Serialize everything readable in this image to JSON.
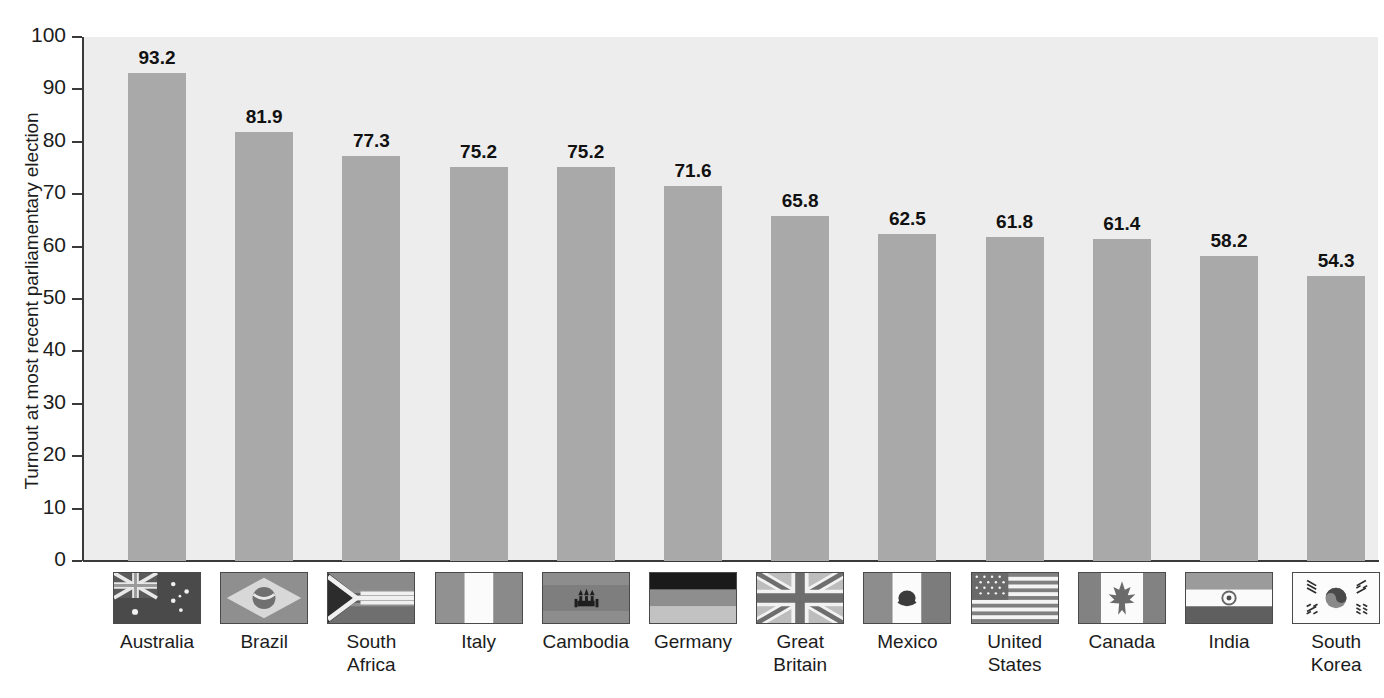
{
  "chart_data": {
    "type": "bar",
    "title": "",
    "xlabel": "",
    "ylabel": "Turnout at most recent parliamentary election",
    "ylim": [
      0,
      100
    ],
    "ytick_labels": [
      "100",
      "90",
      "80",
      "70",
      "60",
      "50",
      "40",
      "30",
      "20",
      "10",
      "0"
    ],
    "yticks": [
      100,
      90,
      80,
      70,
      60,
      50,
      40,
      30,
      20,
      10,
      0
    ],
    "grid": false,
    "legend": "none",
    "categories": [
      "Australia",
      "Brazil",
      "South\nAfrica",
      "Italy",
      "Cambodia",
      "Germany",
      "Great\nBritain",
      "Mexico",
      "United\nStates",
      "Canada",
      "India",
      "South\nKorea"
    ],
    "values": [
      93.2,
      81.9,
      77.3,
      75.2,
      75.2,
      71.6,
      65.8,
      62.5,
      61.8,
      61.4,
      58.2,
      54.3
    ],
    "value_labels": [
      "93.2",
      "81.9",
      "77.3",
      "75.2",
      "75.2",
      "71.6",
      "65.8",
      "62.5",
      "61.8",
      "61.4",
      "58.2",
      "54.3"
    ],
    "flag_icons": [
      "flag-australia-icon",
      "flag-brazil-icon",
      "flag-south-africa-icon",
      "flag-italy-icon",
      "flag-cambodia-icon",
      "flag-germany-icon",
      "flag-great-britain-icon",
      "flag-mexico-icon",
      "flag-united-states-icon",
      "flag-canada-icon",
      "flag-india-icon",
      "flag-south-korea-icon"
    ]
  },
  "colors": {
    "bar_fill": "#a9a9a9",
    "plot_background": "#ededed",
    "page_background": "#ffffff",
    "axis": "#3a3a3a",
    "text": "#1c1c1c",
    "value_label": "#111111"
  }
}
